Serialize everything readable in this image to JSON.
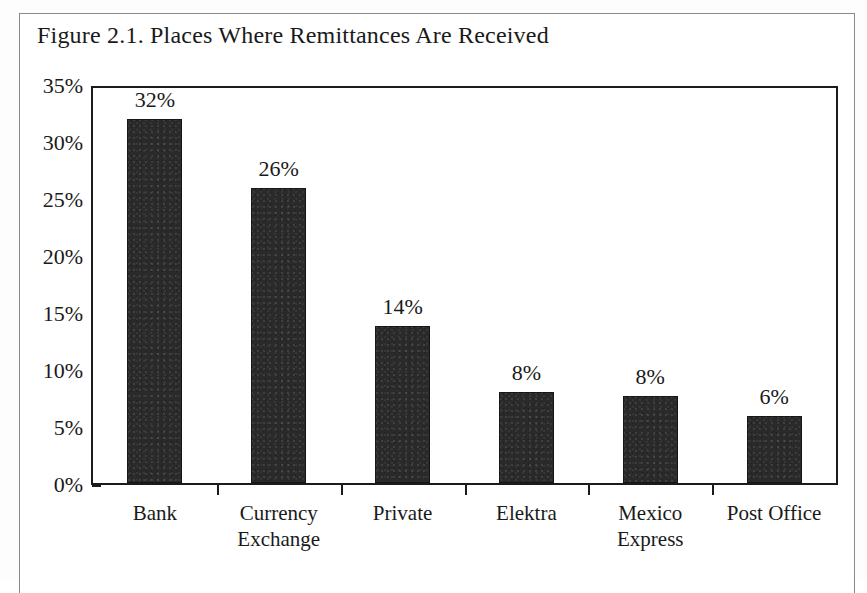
{
  "figure": {
    "title": "Figure 2.1. Places Where Remittances Are Received"
  },
  "chart_data": {
    "type": "bar",
    "title": "Figure 2.1. Places Where Remittances Are Received",
    "xlabel": "",
    "ylabel": "",
    "ylim": [
      0,
      35
    ],
    "ytick_labels": [
      "35%",
      "30%",
      "25%",
      "20%",
      "15%",
      "10%",
      "5%",
      "0%"
    ],
    "ytick_values": [
      35,
      30,
      25,
      20,
      15,
      10,
      5,
      0
    ],
    "grid": false,
    "legend": false,
    "bar_color": "#2a2a2a",
    "frame_color": "#1b1b1b",
    "categories": [
      "Bank",
      "Currency Exchange",
      "Private",
      "Elektra",
      "Mexico Express",
      "Post Office"
    ],
    "category_lines": [
      [
        "Bank"
      ],
      [
        "Currency",
        "Exchange"
      ],
      [
        "Private"
      ],
      [
        "Elektra"
      ],
      [
        "Mexico",
        "Express"
      ],
      [
        "Post Office"
      ]
    ],
    "values": [
      31.9,
      25.9,
      13.8,
      8.0,
      7.6,
      5.9
    ],
    "data_labels": [
      "32%",
      "26%",
      "14%",
      "8%",
      "8%",
      "6%"
    ]
  }
}
